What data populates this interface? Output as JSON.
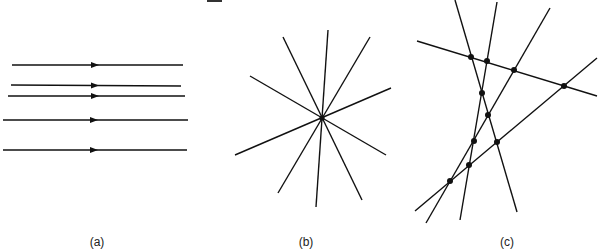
{
  "figure": {
    "stroke_color": "#111111",
    "background": "#ffffff"
  },
  "panels": [
    {
      "id": "a",
      "label": "(a)",
      "kind": "parallel-lines",
      "lines": [
        {
          "x1": 12,
          "y1": 65,
          "x2": 183,
          "y2": 65,
          "arrow_x": 95
        },
        {
          "x1": 11,
          "y1": 85,
          "x2": 181,
          "y2": 86,
          "arrow_x": 95
        },
        {
          "x1": 8,
          "y1": 96,
          "x2": 185,
          "y2": 96,
          "arrow_x": 95
        },
        {
          "x1": 3,
          "y1": 120,
          "x2": 188,
          "y2": 120,
          "arrow_x": 94
        },
        {
          "x1": 3,
          "y1": 150,
          "x2": 187,
          "y2": 150,
          "arrow_x": 94
        }
      ]
    },
    {
      "id": "b",
      "label": "(b)",
      "kind": "concurrent-lines",
      "center": {
        "x": 322,
        "y": 118
      },
      "lines": [
        {
          "x1": 283,
          "y1": 37,
          "x2": 362,
          "y2": 200
        },
        {
          "x1": 328,
          "y1": 30,
          "x2": 316,
          "y2": 207
        },
        {
          "x1": 370,
          "y1": 37,
          "x2": 278,
          "y2": 193
        },
        {
          "x1": 250,
          "y1": 76,
          "x2": 386,
          "y2": 155
        },
        {
          "x1": 391,
          "y1": 88,
          "x2": 235,
          "y2": 155
        }
      ]
    },
    {
      "id": "c",
      "label": "(c)",
      "kind": "lines-in-general-position",
      "lines": [
        {
          "x1": 417,
          "y1": 41,
          "x2": 597,
          "y2": 96
        },
        {
          "x1": 455,
          "y1": 0,
          "x2": 517,
          "y2": 212
        },
        {
          "x1": 497,
          "y1": 2,
          "x2": 460,
          "y2": 220
        },
        {
          "x1": 550,
          "y1": 8,
          "x2": 426,
          "y2": 223
        },
        {
          "x1": 597,
          "y1": 58,
          "x2": 415,
          "y2": 211
        }
      ],
      "intersections": [
        {
          "x": 471,
          "y": 57
        },
        {
          "x": 487,
          "y": 61
        },
        {
          "x": 514,
          "y": 70
        },
        {
          "x": 564,
          "y": 86
        },
        {
          "x": 482,
          "y": 93
        },
        {
          "x": 488,
          "y": 115
        },
        {
          "x": 474,
          "y": 141
        },
        {
          "x": 497,
          "y": 142
        },
        {
          "x": 469,
          "y": 165
        },
        {
          "x": 450,
          "y": 181
        }
      ]
    }
  ],
  "labels": {
    "a": {
      "text": "(a)",
      "x": 97,
      "y": 246
    },
    "b": {
      "text": "(b)",
      "x": 306,
      "y": 246
    },
    "c": {
      "text": "(c)",
      "x": 507,
      "y": 246
    }
  }
}
